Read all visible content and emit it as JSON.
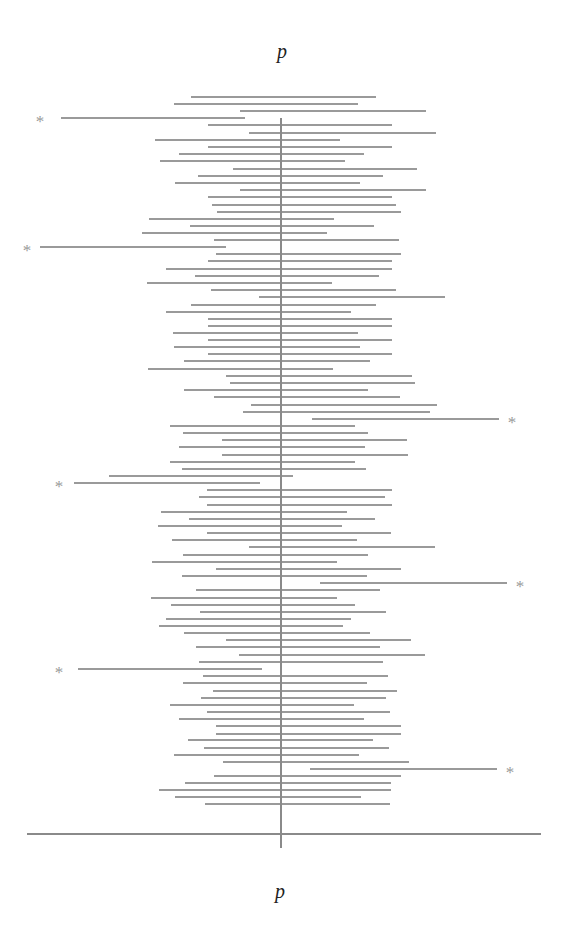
{
  "labels": {
    "top": "p",
    "bottom": "p",
    "miss_marker": "*"
  },
  "colors": {
    "interval": "#9a9a9a",
    "axis": "#8a8a8a",
    "text": "#222222"
  },
  "chart_data": {
    "type": "interval",
    "xlabel": "p",
    "center_x": 281,
    "axis": {
      "x_start": 27,
      "x_end": 541,
      "y": 834
    },
    "center_line": {
      "y_start": 118,
      "y_end": 848
    },
    "intervals": [
      {
        "y": 97,
        "l": 191,
        "r": 376,
        "miss": false
      },
      {
        "y": 104,
        "l": 174,
        "r": 358,
        "miss": false
      },
      {
        "y": 111,
        "l": 240,
        "r": 426,
        "miss": false
      },
      {
        "y": 118,
        "l": 61,
        "r": 245,
        "miss": true,
        "marker_x": 40
      },
      {
        "y": 125,
        "l": 208,
        "r": 392,
        "miss": false
      },
      {
        "y": 133,
        "l": 249,
        "r": 436,
        "miss": false
      },
      {
        "y": 140,
        "l": 155,
        "r": 340,
        "miss": false
      },
      {
        "y": 147,
        "l": 208,
        "r": 392,
        "miss": false
      },
      {
        "y": 154,
        "l": 179,
        "r": 364,
        "miss": false
      },
      {
        "y": 161,
        "l": 160,
        "r": 345,
        "miss": false
      },
      {
        "y": 169,
        "l": 233,
        "r": 417,
        "miss": false
      },
      {
        "y": 176,
        "l": 198,
        "r": 383,
        "miss": false
      },
      {
        "y": 183,
        "l": 175,
        "r": 360,
        "miss": false
      },
      {
        "y": 190,
        "l": 240,
        "r": 426,
        "miss": false
      },
      {
        "y": 197,
        "l": 208,
        "r": 392,
        "miss": false
      },
      {
        "y": 205,
        "l": 212,
        "r": 396,
        "miss": false
      },
      {
        "y": 212,
        "l": 217,
        "r": 401,
        "miss": false
      },
      {
        "y": 219,
        "l": 149,
        "r": 334,
        "miss": false
      },
      {
        "y": 226,
        "l": 190,
        "r": 374,
        "miss": false
      },
      {
        "y": 233,
        "l": 142,
        "r": 327,
        "miss": false
      },
      {
        "y": 240,
        "l": 214,
        "r": 399,
        "miss": false
      },
      {
        "y": 247,
        "l": 40,
        "r": 226,
        "miss": true,
        "marker_x": 27
      },
      {
        "y": 254,
        "l": 216,
        "r": 401,
        "miss": false
      },
      {
        "y": 261,
        "l": 208,
        "r": 392,
        "miss": false
      },
      {
        "y": 269,
        "l": 166,
        "r": 392,
        "miss": false
      },
      {
        "y": 276,
        "l": 195,
        "r": 379,
        "miss": false
      },
      {
        "y": 283,
        "l": 147,
        "r": 332,
        "miss": false
      },
      {
        "y": 290,
        "l": 211,
        "r": 396,
        "miss": false
      },
      {
        "y": 297,
        "l": 259,
        "r": 445,
        "miss": false
      },
      {
        "y": 305,
        "l": 191,
        "r": 376,
        "miss": false
      },
      {
        "y": 312,
        "l": 166,
        "r": 351,
        "miss": false
      },
      {
        "y": 319,
        "l": 208,
        "r": 392,
        "miss": false
      },
      {
        "y": 326,
        "l": 208,
        "r": 392,
        "miss": false
      },
      {
        "y": 333,
        "l": 173,
        "r": 358,
        "miss": false
      },
      {
        "y": 340,
        "l": 208,
        "r": 392,
        "miss": false
      },
      {
        "y": 347,
        "l": 174,
        "r": 360,
        "miss": false
      },
      {
        "y": 354,
        "l": 208,
        "r": 392,
        "miss": false
      },
      {
        "y": 361,
        "l": 184,
        "r": 370,
        "miss": false
      },
      {
        "y": 369,
        "l": 148,
        "r": 333,
        "miss": false
      },
      {
        "y": 376,
        "l": 226,
        "r": 412,
        "miss": false
      },
      {
        "y": 383,
        "l": 230,
        "r": 415,
        "miss": false
      },
      {
        "y": 390,
        "l": 184,
        "r": 368,
        "miss": false
      },
      {
        "y": 397,
        "l": 214,
        "r": 400,
        "miss": false
      },
      {
        "y": 405,
        "l": 251,
        "r": 437,
        "miss": false
      },
      {
        "y": 412,
        "l": 243,
        "r": 430,
        "miss": false
      },
      {
        "y": 419,
        "l": 312,
        "r": 499,
        "miss": true,
        "marker_x": 512
      },
      {
        "y": 426,
        "l": 170,
        "r": 355,
        "miss": false
      },
      {
        "y": 433,
        "l": 183,
        "r": 368,
        "miss": false
      },
      {
        "y": 440,
        "l": 222,
        "r": 407,
        "miss": false
      },
      {
        "y": 447,
        "l": 179,
        "r": 365,
        "miss": false
      },
      {
        "y": 455,
        "l": 222,
        "r": 408,
        "miss": false
      },
      {
        "y": 462,
        "l": 170,
        "r": 355,
        "miss": false
      },
      {
        "y": 469,
        "l": 182,
        "r": 366,
        "miss": false
      },
      {
        "y": 476,
        "l": 109,
        "r": 293,
        "miss": false
      },
      {
        "y": 483,
        "l": 74,
        "r": 260,
        "miss": true,
        "marker_x": 59
      },
      {
        "y": 490,
        "l": 207,
        "r": 392,
        "miss": false
      },
      {
        "y": 497,
        "l": 199,
        "r": 385,
        "miss": false
      },
      {
        "y": 505,
        "l": 207,
        "r": 392,
        "miss": false
      },
      {
        "y": 512,
        "l": 161,
        "r": 347,
        "miss": false
      },
      {
        "y": 519,
        "l": 189,
        "r": 375,
        "miss": false
      },
      {
        "y": 526,
        "l": 158,
        "r": 342,
        "miss": false
      },
      {
        "y": 533,
        "l": 207,
        "r": 391,
        "miss": false
      },
      {
        "y": 540,
        "l": 172,
        "r": 357,
        "miss": false
      },
      {
        "y": 547,
        "l": 249,
        "r": 435,
        "miss": false
      },
      {
        "y": 555,
        "l": 183,
        "r": 368,
        "miss": false
      },
      {
        "y": 562,
        "l": 152,
        "r": 337,
        "miss": false
      },
      {
        "y": 569,
        "l": 216,
        "r": 401,
        "miss": false
      },
      {
        "y": 576,
        "l": 182,
        "r": 367,
        "miss": false
      },
      {
        "y": 583,
        "l": 320,
        "r": 507,
        "miss": true,
        "marker_x": 520
      },
      {
        "y": 590,
        "l": 196,
        "r": 380,
        "miss": false
      },
      {
        "y": 598,
        "l": 151,
        "r": 337,
        "miss": false
      },
      {
        "y": 605,
        "l": 171,
        "r": 355,
        "miss": false
      },
      {
        "y": 612,
        "l": 200,
        "r": 386,
        "miss": false
      },
      {
        "y": 619,
        "l": 166,
        "r": 351,
        "miss": false
      },
      {
        "y": 626,
        "l": 159,
        "r": 343,
        "miss": false
      },
      {
        "y": 633,
        "l": 184,
        "r": 370,
        "miss": false
      },
      {
        "y": 640,
        "l": 226,
        "r": 411,
        "miss": false
      },
      {
        "y": 647,
        "l": 196,
        "r": 380,
        "miss": false
      },
      {
        "y": 655,
        "l": 239,
        "r": 425,
        "miss": false
      },
      {
        "y": 662,
        "l": 199,
        "r": 383,
        "miss": false
      },
      {
        "y": 669,
        "l": 78,
        "r": 262,
        "miss": true,
        "marker_x": 59
      },
      {
        "y": 676,
        "l": 203,
        "r": 388,
        "miss": false
      },
      {
        "y": 683,
        "l": 183,
        "r": 367,
        "miss": false
      },
      {
        "y": 691,
        "l": 213,
        "r": 397,
        "miss": false
      },
      {
        "y": 698,
        "l": 201,
        "r": 386,
        "miss": false
      },
      {
        "y": 705,
        "l": 170,
        "r": 354,
        "miss": false
      },
      {
        "y": 712,
        "l": 207,
        "r": 390,
        "miss": false
      },
      {
        "y": 719,
        "l": 179,
        "r": 364,
        "miss": false
      },
      {
        "y": 726,
        "l": 216,
        "r": 401,
        "miss": false
      },
      {
        "y": 734,
        "l": 216,
        "r": 401,
        "miss": false
      },
      {
        "y": 740,
        "l": 188,
        "r": 373,
        "miss": false
      },
      {
        "y": 748,
        "l": 204,
        "r": 389,
        "miss": false
      },
      {
        "y": 755,
        "l": 174,
        "r": 359,
        "miss": false
      },
      {
        "y": 762,
        "l": 223,
        "r": 409,
        "miss": false
      },
      {
        "y": 769,
        "l": 310,
        "r": 497,
        "miss": true,
        "marker_x": 510
      },
      {
        "y": 776,
        "l": 214,
        "r": 401,
        "miss": false
      },
      {
        "y": 783,
        "l": 185,
        "r": 391,
        "miss": false
      },
      {
        "y": 790,
        "l": 159,
        "r": 391,
        "miss": false
      },
      {
        "y": 797,
        "l": 175,
        "r": 361,
        "miss": false
      },
      {
        "y": 804,
        "l": 205,
        "r": 390,
        "miss": false
      }
    ]
  }
}
